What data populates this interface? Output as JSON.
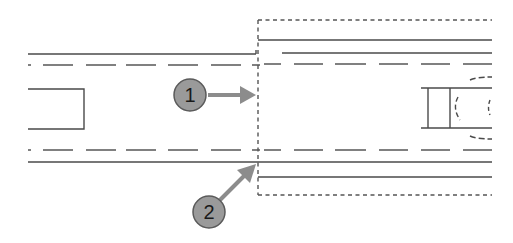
{
  "diagram": {
    "title": "",
    "colors": {
      "line": "#4a4a4a",
      "dashed_box": "#555555",
      "callout_fill": "#9a9a9a",
      "callout_stroke": "#5a5a5a",
      "arrow": "#8c8c8c",
      "label": "#1a1a1a"
    },
    "callouts": [
      {
        "id": 1,
        "label": "1",
        "target": "dashed-boundary-at-centerline"
      },
      {
        "id": 2,
        "label": "2",
        "target": "dashed-boundary-at-lower-edge"
      }
    ],
    "elements": [
      "left-road-segment",
      "right-road-segment-in-dashed-box",
      "left-rectangle",
      "right-curb-shape"
    ]
  }
}
